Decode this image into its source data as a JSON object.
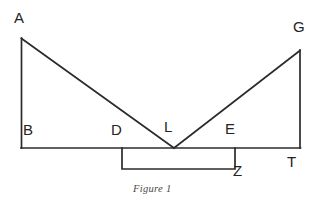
{
  "figure": {
    "caption": "Figure 1",
    "line_color": "#2b2b2b",
    "background_color": "#ffffff",
    "label_color": "#232323",
    "labels": {
      "A": "A",
      "G": "G",
      "B": "B",
      "D": "D",
      "L": "L",
      "E": "E",
      "T": "T",
      "Z": "Z"
    },
    "geometry": {
      "baseline": {
        "from": "B",
        "to": "T",
        "y": 148
      },
      "left_vertical": {
        "from": "B",
        "to": "A",
        "x": 21
      },
      "right_vertical": {
        "from": "T",
        "to": "G",
        "x": 300
      },
      "left_diagonal": {
        "from": "A",
        "to": "L"
      },
      "right_diagonal": {
        "from": "L",
        "to": "G"
      },
      "bracket": {
        "from": "D",
        "to": "E",
        "label": "Z",
        "depth": 21
      }
    },
    "points": {
      "A": {
        "x": 21,
        "y": 38
      },
      "G": {
        "x": 300,
        "y": 50
      },
      "B": {
        "x": 21,
        "y": 148
      },
      "T": {
        "x": 300,
        "y": 148
      },
      "L": {
        "x": 174,
        "y": 148
      },
      "D": {
        "x": 122,
        "y": 148
      },
      "E": {
        "x": 235,
        "y": 148
      }
    }
  }
}
